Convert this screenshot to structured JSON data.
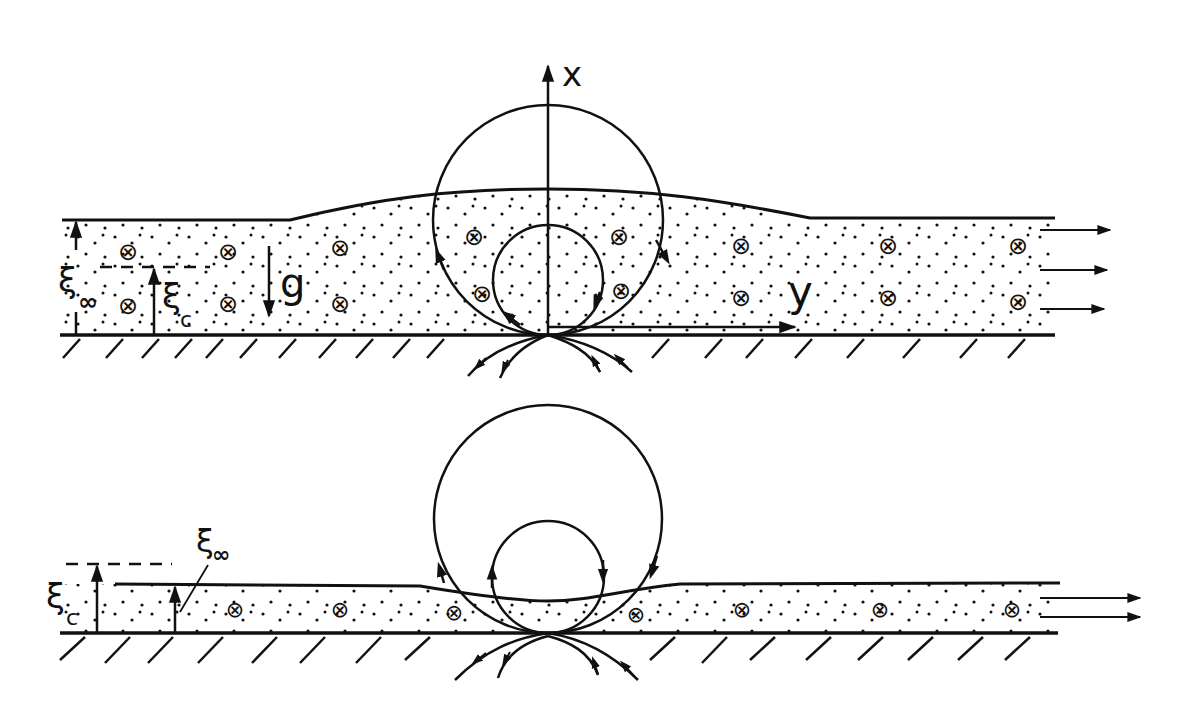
{
  "figure": {
    "type": "diagram",
    "colors": {
      "ink": "#111111",
      "background": "#ffffff"
    },
    "top_panel": {
      "labels": {
        "x_axis": "x",
        "y_axis": "y",
        "gravity": "g",
        "xi_inf": "ξ",
        "xi_inf_sub": "∞",
        "xi_c": "ξ",
        "xi_c_sub": "c"
      },
      "vortex_symbol": "⊗",
      "vortex_count": 12,
      "outflow_arrows": 3
    },
    "bottom_panel": {
      "labels": {
        "xi_inf": "ξ",
        "xi_inf_sub": "∞",
        "xi_c": "ξ",
        "xi_c_sub": "c"
      },
      "vortex_symbol": "⊗",
      "vortex_count": 7,
      "outflow_arrows": 2
    }
  }
}
